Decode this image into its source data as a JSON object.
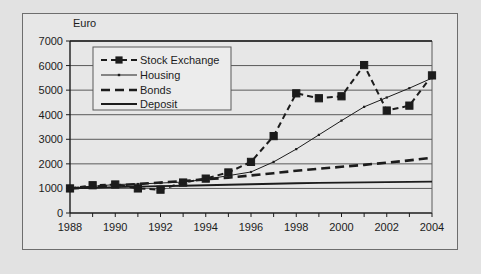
{
  "chart_data": {
    "type": "line",
    "title": "",
    "subtitle": "",
    "xlabel": "",
    "ylabel": "Euro",
    "x": [
      1988,
      1989,
      1990,
      1991,
      1992,
      1993,
      1994,
      1995,
      1996,
      1997,
      1998,
      1999,
      2000,
      2001,
      2002,
      2003,
      2004
    ],
    "xlim": [
      1988,
      2004
    ],
    "ylim": [
      0,
      7000
    ],
    "ytick_labels": [
      "0",
      "1000",
      "2000",
      "3000",
      "4000",
      "5000",
      "6000",
      "7000"
    ],
    "ytick_values": [
      0,
      1000,
      2000,
      3000,
      4000,
      5000,
      6000,
      7000
    ],
    "xtick_labels": [
      "1988",
      "1990",
      "1992",
      "1994",
      "1996",
      "1998",
      "2000",
      "2002",
      "2004"
    ],
    "xtick_values": [
      1988,
      1990,
      1992,
      1994,
      1996,
      1998,
      2000,
      2002,
      2004
    ],
    "grid": "horizontal",
    "legend_position": "upper-left-inside",
    "series": [
      {
        "name": "Stock Exchange",
        "style": "dashed",
        "marker": "square",
        "color": "#1c1c1c",
        "values": [
          1000,
          1130,
          1160,
          1000,
          950,
          1240,
          1400,
          1650,
          2080,
          3130,
          4870,
          4670,
          4750,
          6020,
          4170,
          4370,
          5600
        ]
      },
      {
        "name": "Housing",
        "style": "solid-thin",
        "marker": "dot",
        "color": "#1c1c1c",
        "values": [
          1000,
          1080,
          1160,
          1180,
          1220,
          1260,
          1370,
          1520,
          1670,
          2080,
          2600,
          3180,
          3760,
          4320,
          4700,
          5080,
          5490
        ]
      },
      {
        "name": "Bonds",
        "style": "dashed-thick",
        "marker": "none",
        "color": "#1c1c1c",
        "values": [
          1000,
          1060,
          1120,
          1180,
          1240,
          1300,
          1370,
          1440,
          1530,
          1620,
          1720,
          1800,
          1880,
          1960,
          2050,
          2140,
          2250
        ]
      },
      {
        "name": "Deposit",
        "style": "solid-thick",
        "marker": "none",
        "color": "#1c1c1c",
        "values": [
          1000,
          1020,
          1050,
          1070,
          1090,
          1110,
          1130,
          1150,
          1170,
          1190,
          1210,
          1225,
          1240,
          1250,
          1260,
          1270,
          1280
        ]
      }
    ]
  },
  "legend": {
    "items": [
      {
        "label": "Stock Exchange"
      },
      {
        "label": "Housing"
      },
      {
        "label": "Bonds"
      },
      {
        "label": "Deposit"
      }
    ]
  },
  "colors": {
    "ink": "#1c1c1c",
    "grid": "#5a5a5a",
    "plot_background": "#e7e7e7",
    "page_background": "#e2e2e2",
    "legend_background": "#ececec"
  }
}
